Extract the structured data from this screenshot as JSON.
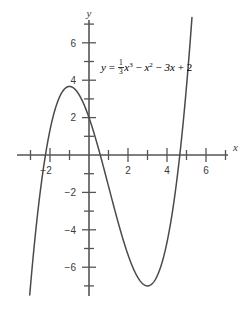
{
  "figure": {
    "title": "",
    "background_color": "#ffffff",
    "curve_color": "#4a4a4a",
    "axis_color": "#555555",
    "text_color": "#3a3a3a"
  },
  "equation": {
    "lhs": "y",
    "equals": "=",
    "frac_numerator": "1",
    "frac_denominator": "3",
    "term1_var": "x",
    "term1_exp": "3",
    "op1": "−",
    "term2_var": "x",
    "term2_exp": "2",
    "op2": "−",
    "term3": "3x",
    "op3": "+",
    "term4": "2",
    "plain": "y = 1/3 x^3 − x^2 − 3x + 2"
  },
  "axes": {
    "x_label": "x",
    "y_label": "y",
    "x_tick_labels": [
      "−2",
      "2",
      "4",
      "6"
    ],
    "y_tick_labels": [
      "6",
      "4",
      "2",
      "−2",
      "−4",
      "−6"
    ],
    "x_ticks_all": [
      -3,
      -2,
      -1,
      1,
      2,
      3,
      4,
      5,
      6,
      7
    ],
    "y_ticks_all": [
      7,
      6,
      5,
      4,
      3,
      2,
      1,
      -1,
      -2,
      -3,
      -4,
      -5,
      -6,
      -7
    ],
    "xlim": [
      -3.7,
      7.1
    ],
    "ylim": [
      -7.5,
      7.4
    ]
  },
  "chart_data": {
    "type": "line",
    "title": "",
    "xlabel": "x",
    "ylabel": "y",
    "xlim": [
      -3.7,
      7.1
    ],
    "ylim": [
      -7.5,
      7.4
    ],
    "grid": false,
    "legend": "none",
    "annotations": [
      {
        "text": "y = 1/3 x^3 − x^2 − 3x + 2",
        "x": 0.6,
        "y": 5.1
      }
    ],
    "function": "y = (1/3)x^3 - x^2 - 3x + 2",
    "series": [
      {
        "name": "y = 1/3 x^3 - x^2 - 3x + 2",
        "x": [
          -3.6,
          -3.4,
          -3.2,
          -3.0,
          -2.8,
          -2.6,
          -2.4,
          -2.2,
          -2.0,
          -1.8,
          -1.6,
          -1.4,
          -1.2,
          -1.0,
          -0.8,
          -0.6,
          -0.4,
          -0.2,
          0.0,
          0.2,
          0.4,
          0.6,
          0.8,
          1.0,
          1.2,
          1.4,
          1.6,
          1.8,
          2.0,
          2.2,
          2.4,
          2.6,
          2.8,
          3.0,
          3.2,
          3.4,
          3.6,
          3.8,
          4.0,
          4.2,
          4.4,
          4.6,
          4.8,
          5.0,
          5.2,
          5.35
        ],
        "y": [
          -12.41,
          -10.78,
          -9.25,
          -7.0,
          -6.49,
          -5.25,
          -4.12,
          -3.1,
          -2.67,
          -1.4,
          -0.75,
          -0.21,
          0.22,
          2.0,
          2.63,
          2.82,
          2.95,
          3.03,
          2.0,
          2.56,
          2.25,
          1.88,
          1.46,
          1.0,
          0.5,
          -0.03,
          -0.59,
          -1.18,
          -1.33,
          -2.41,
          -3.05,
          -3.7,
          -4.35,
          -5.0,
          -5.63,
          -6.24,
          -6.83,
          -7.39,
          -6.67,
          -7.14,
          -6.99,
          -6.45,
          -5.49,
          -4.0,
          -2.04,
          -0.28
        ]
      }
    ]
  }
}
